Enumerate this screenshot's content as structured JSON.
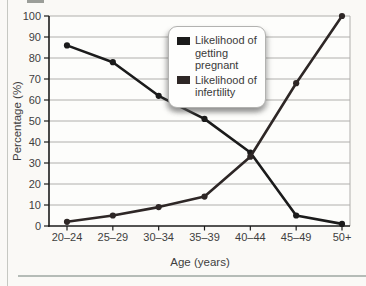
{
  "chart_data": {
    "type": "line",
    "title": "",
    "xlabel": "Age (years)",
    "ylabel": "Percentage (%)",
    "categories": [
      "20–24",
      "25–29",
      "30–34",
      "35–39",
      "40–44",
      "45–49",
      "50+"
    ],
    "series": [
      {
        "name": "Likelihood of getting pregnant",
        "color": "#1b1b1b",
        "values": [
          86,
          78,
          62,
          51,
          35,
          5,
          1
        ]
      },
      {
        "name": "Likelihood of infertility",
        "color": "#2e2726",
        "values": [
          2,
          5,
          9,
          14,
          33,
          68,
          100
        ]
      }
    ],
    "ylim": [
      0,
      100
    ],
    "yticks": [
      0,
      10,
      20,
      30,
      40,
      50,
      60,
      70,
      80,
      90,
      100
    ],
    "grid": true,
    "legend_position": "top-center"
  },
  "colors": {
    "page_bg": "#faf9f6",
    "grid": "#b0afac",
    "axis": "#1b1b1b",
    "tick_text": "#3e3e3e"
  }
}
